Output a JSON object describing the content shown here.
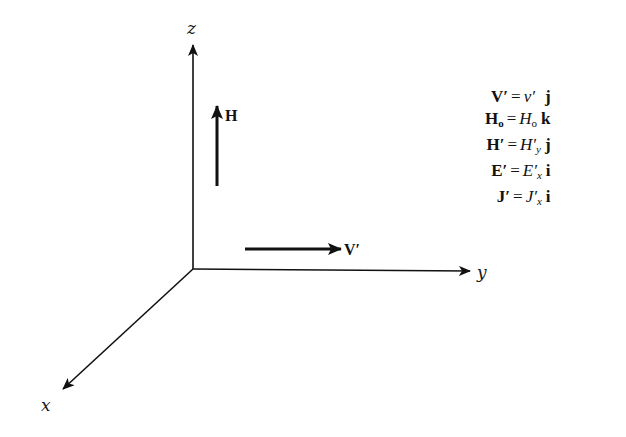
{
  "diagram": {
    "axes": {
      "z": {
        "label": "z"
      },
      "y": {
        "label": "y"
      },
      "x": {
        "label": "x"
      }
    },
    "vectors": {
      "H": {
        "label": "H",
        "direction": "up"
      },
      "V": {
        "label": "V′",
        "direction": "right"
      }
    },
    "equations": [
      {
        "lhs": "V′",
        "op": "=",
        "rhs": "v′",
        "sub": "",
        "unit": "j"
      },
      {
        "lhs": "H",
        "lhs_sub": "o",
        "op": "=",
        "rhs": "H",
        "sub": "o",
        "unit": "k"
      },
      {
        "lhs": "H′",
        "op": "=",
        "rhs": "H′",
        "sub": "y",
        "unit": "j"
      },
      {
        "lhs": "E′",
        "op": "=",
        "rhs": "E′",
        "sub": "x",
        "unit": "i"
      },
      {
        "lhs": "J′",
        "op": "=",
        "rhs": "J′",
        "sub": "x",
        "unit": "i"
      }
    ],
    "colors": {
      "ink": "#111111",
      "background": "#ffffff"
    }
  }
}
